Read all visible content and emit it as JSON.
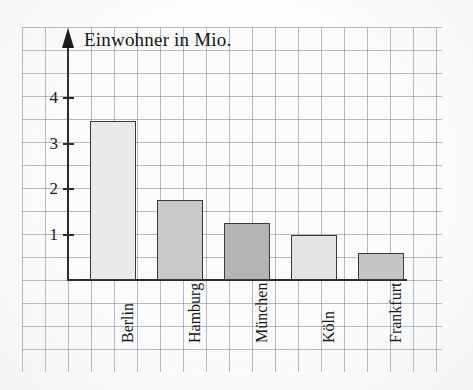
{
  "chart_data": {
    "type": "bar",
    "title": "Einwohner in Mio.",
    "xlabel": "",
    "ylabel": "Einwohner in Mio.",
    "categories": [
      "Berlin",
      "Hamburg",
      "München",
      "Köln",
      "Frankfurt"
    ],
    "values": [
      3.5,
      1.75,
      1.25,
      1.0,
      0.6
    ],
    "ylim": [
      0,
      4.6
    ],
    "yticks": [
      1,
      2,
      3,
      4
    ],
    "ytick_labels": [
      "1",
      "2",
      "3",
      "4"
    ],
    "grid": true,
    "legend": "none",
    "bar_colors": [
      "#e9e9e9",
      "#c9c9c9",
      "#b4b4b4",
      "#e3e3e3",
      "#c4c4c4"
    ],
    "bar_edge_color": "#3a3a3a",
    "axis_color": "#2b2b2b",
    "grid_color": "#7a82a0",
    "background": "#fcfcfc"
  },
  "axis": {
    "y_arrow_icon": "arrow-up-icon",
    "ticks": [
      {
        "label": "4",
        "value": 4
      },
      {
        "label": "3",
        "value": 3
      },
      {
        "label": "2",
        "value": 2
      },
      {
        "label": "1",
        "value": 1
      }
    ]
  },
  "bars": [
    {
      "label": "Berlin",
      "value": 3.5,
      "color": "#e9e9e9"
    },
    {
      "label": "Hamburg",
      "value": 1.75,
      "color": "#c9c9c9"
    },
    {
      "label": "München",
      "value": 1.25,
      "color": "#b4b4b4"
    },
    {
      "label": "Köln",
      "value": 1.0,
      "color": "#e3e3e3"
    },
    {
      "label": "Frankfurt",
      "value": 0.6,
      "color": "#c4c4c4"
    }
  ]
}
